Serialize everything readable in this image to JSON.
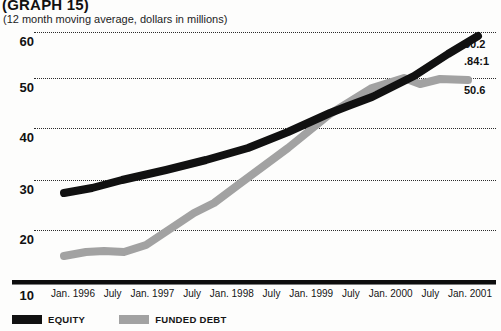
{
  "header": {
    "title": "(GRAPH 15)",
    "subtitle": "(12 month moving average, dollars in millions)"
  },
  "annotations": {
    "equity_end": "60.2",
    "ratio": ".84:1",
    "debt_end": "50.6"
  },
  "legend": {
    "items": [
      {
        "label": "EQUITY",
        "color": "#111111",
        "name": "legend-equity"
      },
      {
        "label": "FUNDED DEBT",
        "color": "#a2a2a2",
        "name": "legend-funded-debt"
      }
    ]
  },
  "chart_data": {
    "type": "line",
    "title": "(GRAPH 15)",
    "subtitle": "(12 month moving average, dollars in millions)",
    "xlabel": "",
    "ylabel": "",
    "ylim": [
      10,
      62
    ],
    "yticks": [
      60,
      50,
      40,
      30,
      20,
      10
    ],
    "grid": true,
    "legend_position": "bottom-left",
    "categories": [
      "Jan. 1996",
      "July",
      "Jan. 1997",
      "July",
      "Jan. 1998",
      "July",
      "Jan. 1999",
      "July",
      "Jan. 2000",
      "July",
      "Jan. 2001"
    ],
    "series": [
      {
        "name": "EQUITY",
        "color": "#111111",
        "values": [
          29.5,
          30.8,
          32.5,
          34.5,
          36.8,
          39.5,
          42.5,
          46.0,
          49.5,
          52.0,
          54.5,
          57.5,
          60.2
        ],
        "x": [
          "Jan. 1996",
          "Apr. 1996",
          "July 1996",
          "Jan. 1997",
          "July 1997",
          "Jan. 1998",
          "July 1998",
          "Jan. 1999",
          "Apr. 1999",
          "July 1999",
          "Jan. 2000",
          "July 2000",
          "Jan. 2001"
        ],
        "end_value": 60.2
      },
      {
        "name": "FUNDED DEBT",
        "color": "#a2a2a2",
        "values": [
          17.5,
          18.2,
          18.3,
          18.2,
          19.5,
          22.5,
          25.5,
          27.5,
          31.0,
          38.0,
          44.5,
          49.5,
          51.5,
          49.8,
          51.0,
          50.6
        ],
        "x": [
          "Jan. 1996",
          "Apr. 1996",
          "July 1996",
          "Oct. 1996",
          "Jan. 1997",
          "Apr. 1997",
          "July 1997",
          "Oct. 1997",
          "Jan. 1998",
          "July 1998",
          "Jan. 1999",
          "July 1999",
          "Jan. 2000",
          "Apr. 2000",
          "July 2000",
          "Jan. 2001"
        ],
        "end_value": 50.6
      }
    ],
    "ratio_annotation": ".84:1"
  }
}
